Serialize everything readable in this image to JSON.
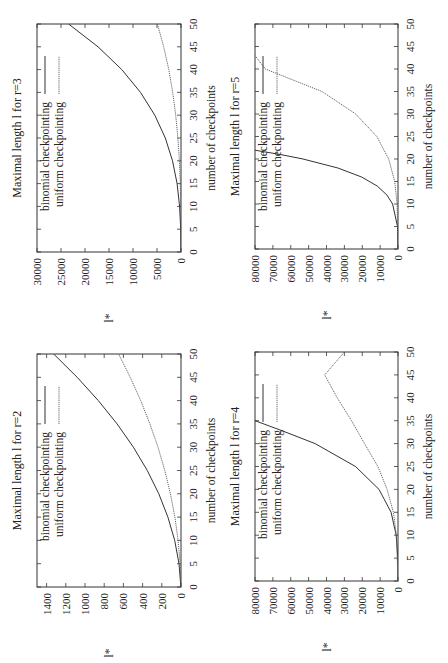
{
  "chart_data": [
    {
      "panel": "top-left",
      "type": "line",
      "title": "Maximal length l for r=3",
      "xlabel": "number of checkpoints",
      "ylabel": "l*",
      "xlim": [
        0,
        50
      ],
      "ylim": [
        0,
        30000
      ],
      "xticks": [
        0,
        5,
        10,
        15,
        20,
        25,
        30,
        35,
        40,
        45,
        50
      ],
      "yticks": [
        0,
        5000,
        10000,
        15000,
        20000,
        25000,
        30000
      ],
      "orientation": "rotated-90-ccw",
      "legend": [
        "binomial checkpointing",
        "uniform checkpointing"
      ],
      "series": [
        {
          "name": "binomial checkpointing",
          "style": "solid",
          "x": [
            0,
            5,
            10,
            15,
            20,
            25,
            30,
            35,
            40,
            45,
            50
          ],
          "values": [
            1,
            56,
            286,
            816,
            1771,
            3276,
            5456,
            8436,
            12341,
            17296,
            23426
          ]
        },
        {
          "name": "uniform checkpointing",
          "style": "dotted",
          "x": [
            0,
            5,
            10,
            15,
            20,
            25,
            30,
            35,
            40,
            45,
            50
          ],
          "values": [
            0,
            8,
            49,
            152,
            343,
            650,
            1103,
            1728,
            2552,
            3605,
            4913
          ]
        }
      ]
    },
    {
      "panel": "top-right",
      "type": "line",
      "title": "Maximal length l for r=5",
      "xlabel": "number of checkpoints",
      "ylabel": "l*",
      "xlim": [
        0,
        50
      ],
      "ylim": [
        0,
        80000
      ],
      "xticks": [
        0,
        5,
        10,
        15,
        20,
        25,
        30,
        35,
        40,
        45,
        50
      ],
      "yticks": [
        0,
        10000,
        20000,
        30000,
        40000,
        50000,
        60000,
        70000,
        80000
      ],
      "orientation": "rotated-90-ccw",
      "legend": [
        "binomial checkpointing",
        "uniform checkpointing"
      ],
      "series": [
        {
          "name": "binomial checkpointing",
          "style": "solid",
          "x": [
            0,
            5,
            10,
            12,
            14,
            16,
            18,
            20,
            21,
            22
          ],
          "values": [
            1,
            252,
            3003,
            6188,
            11628,
            20349,
            33649,
            53130,
            65780,
            80730
          ]
        },
        {
          "name": "uniform checkpointing",
          "style": "dotted",
          "x": [
            0,
            10,
            15,
            20,
            25,
            30,
            35,
            40,
            43
          ],
          "values": [
            0,
            525,
            1842,
            5200,
            11881,
            23642,
            42523,
            74233,
            80000
          ]
        }
      ]
    },
    {
      "panel": "bottom-left",
      "type": "line",
      "title": "Maximal length l for r=2",
      "xlabel": "number of checkpoints",
      "ylabel": "l*",
      "xlim": [
        0,
        50
      ],
      "ylim": [
        0,
        1500
      ],
      "xticks": [
        0,
        5,
        10,
        15,
        20,
        25,
        30,
        35,
        40,
        45,
        50
      ],
      "yticks": [
        0,
        200,
        400,
        600,
        800,
        1000,
        1200,
        1400
      ],
      "orientation": "rotated-90-ccw",
      "legend": [
        "binomial checkpointing",
        "uniform checkpointing"
      ],
      "series": [
        {
          "name": "binomial checkpointing",
          "style": "solid",
          "x": [
            0,
            5,
            10,
            15,
            20,
            25,
            30,
            35,
            40,
            45,
            50
          ],
          "values": [
            1,
            21,
            66,
            136,
            231,
            351,
            496,
            666,
            861,
            1081,
            1326
          ]
        },
        {
          "name": "uniform checkpointing",
          "style": "dotted",
          "x": [
            0,
            5,
            10,
            15,
            20,
            25,
            30,
            35,
            40,
            45,
            50
          ],
          "values": [
            0,
            9,
            30,
            64,
            110,
            169,
            240,
            324,
            420,
            529,
            650
          ]
        }
      ]
    },
    {
      "panel": "bottom-right",
      "type": "line",
      "title": "Maximal length l for r=4",
      "xlabel": "number of checkpoints",
      "ylabel": "l*",
      "xlim": [
        0,
        50
      ],
      "ylim": [
        0,
        80000
      ],
      "xticks": [
        0,
        5,
        10,
        15,
        20,
        25,
        30,
        35,
        40,
        45,
        50
      ],
      "yticks": [
        0,
        10000,
        20000,
        30000,
        40000,
        50000,
        60000,
        70000,
        80000
      ],
      "orientation": "rotated-90-ccw",
      "legend": [
        "binomial checkpointing",
        "uniform checkpointing"
      ],
      "series": [
        {
          "name": "binomial checkpointing",
          "style": "solid",
          "x": [
            0,
            5,
            10,
            15,
            20,
            25,
            30,
            33,
            35
          ],
          "values": [
            1,
            126,
            1001,
            3876,
            10626,
            23751,
            46376,
            66045,
            80000
          ]
        },
        {
          "name": "uniform checkpointing",
          "style": "dotted",
          "x": [
            0,
            10,
            15,
            20,
            25,
            30,
            35,
            40,
            45,
            50
          ],
          "values": [
            0,
            915,
            2560,
            6120,
            11245,
            18760,
            26000,
            34000,
            41000,
            30000
          ]
        }
      ]
    }
  ],
  "panels": [
    {
      "id": "r3",
      "title": "Maximal length l for r=3",
      "xlabel": "number of checkpoints",
      "ylabel": "l*",
      "legend": {
        "binomial": "binomial checkpointing",
        "uniform": "uniform checkpointing"
      },
      "yticklabels": [
        "0",
        "5000",
        "10000",
        "15000",
        "20000",
        "25000",
        "30000"
      ],
      "xticklabels": [
        "0",
        "5",
        "10",
        "15",
        "20",
        "25",
        "30",
        "35",
        "40",
        "45",
        "50"
      ]
    },
    {
      "id": "r5",
      "title": "Maximal length l for r=5",
      "xlabel": "number of checkpoints",
      "ylabel": "l*",
      "legend": {
        "binomial": "binomial checkpointing",
        "uniform": "uniform checkpointing"
      },
      "yticklabels": [
        "0",
        "10000",
        "20000",
        "30000",
        "40000",
        "50000",
        "60000",
        "70000",
        "80000"
      ],
      "xticklabels": [
        "0",
        "5",
        "10",
        "15",
        "20",
        "25",
        "30",
        "35",
        "40",
        "45",
        "50"
      ]
    },
    {
      "id": "r2",
      "title": "Maximal length l for r=2",
      "xlabel": "number of checkpoints",
      "ylabel": "l*",
      "legend": {
        "binomial": "binomial checkpointing",
        "uniform": "uniform checkpointing"
      },
      "yticklabels": [
        "0",
        "200",
        "400",
        "600",
        "800",
        "1000",
        "1200",
        "1400"
      ],
      "xticklabels": [
        "0",
        "5",
        "10",
        "15",
        "20",
        "25",
        "30",
        "35",
        "40",
        "45",
        "50"
      ]
    },
    {
      "id": "r4",
      "title": "Maximal length l for r=4",
      "xlabel": "number of checkpoints",
      "ylabel": "l*",
      "legend": {
        "binomial": "binomial checkpointing",
        "uniform": "uniform checkpointing"
      },
      "yticklabels": [
        "0",
        "10000",
        "20000",
        "30000",
        "40000",
        "50000",
        "60000",
        "70000",
        "80000"
      ],
      "xticklabels": [
        "0",
        "5",
        "10",
        "15",
        "20",
        "25",
        "30",
        "35",
        "40",
        "45",
        "50"
      ]
    }
  ]
}
